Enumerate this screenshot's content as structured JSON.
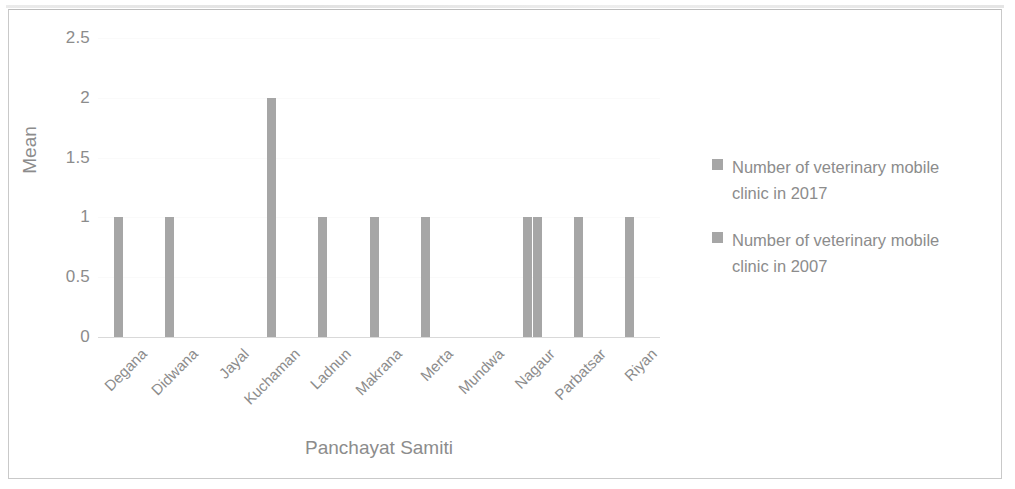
{
  "chart_data": {
    "type": "bar",
    "title": "",
    "xlabel": "Panchayat Samiti",
    "ylabel": "Mean",
    "ylim": [
      0,
      2.5
    ],
    "ytick_labels": [
      "0",
      "0.5",
      "1",
      "1.5",
      "2",
      "2.5"
    ],
    "ytick_values": [
      0,
      0.5,
      1,
      1.5,
      2,
      2.5
    ],
    "grid": true,
    "legend_position": "right",
    "categories": [
      "Degana",
      "Didwana",
      "Jayal",
      "Kuchaman",
      "Ladnun",
      "Makrana",
      "Merta",
      "Mundwa",
      "Nagaur",
      "Parbatsar",
      "Riyan"
    ],
    "series": [
      {
        "name": "Number of veterinary mobile clinic in 2017",
        "color": "#a6a6a6",
        "values": [
          1,
          1,
          0,
          2,
          1,
          1,
          1,
          0,
          1,
          1,
          1
        ]
      },
      {
        "name": "Number of veterinary mobile clinic in 2007",
        "color": "#a6a6a6",
        "values": [
          0,
          0,
          0,
          0,
          0,
          0,
          0,
          0,
          1,
          0,
          0
        ]
      }
    ]
  },
  "legend": {
    "items": [
      {
        "label": "Number of veterinary mobile clinic in 2017"
      },
      {
        "label": "Number of veterinary mobile clinic in 2007"
      }
    ]
  }
}
